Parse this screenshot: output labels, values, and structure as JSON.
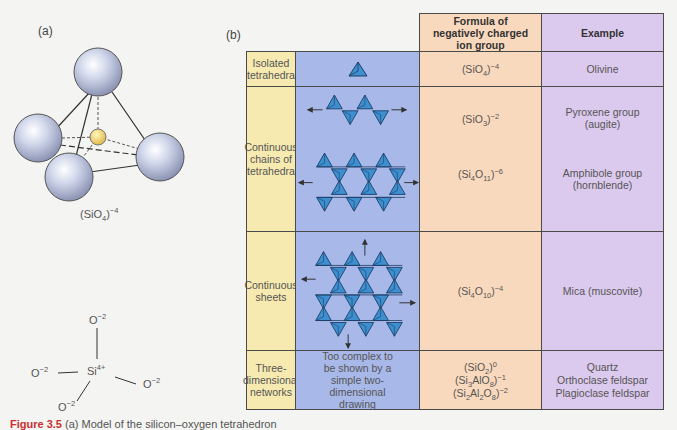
{
  "panel_a": {
    "label": "(a)",
    "formula": {
      "base": "(SiO",
      "sub": "4",
      "close": ")",
      "sup": "−4"
    },
    "bond_diagram": {
      "center": {
        "base": "Si",
        "sup": "4+"
      },
      "oxygens": [
        {
          "base": "O",
          "sup": "−2",
          "position": "top"
        },
        {
          "base": "O",
          "sup": "−2",
          "position": "left"
        },
        {
          "base": "O",
          "sup": "−2",
          "position": "right"
        },
        {
          "base": "O",
          "sup": "−2",
          "position": "bottom-left"
        }
      ]
    }
  },
  "panel_b": {
    "label": "(b)",
    "headers": {
      "formula": "Formula of negatively charged ion group",
      "example": "Example"
    },
    "rows": [
      {
        "structure": "Isolated tetrahedra",
        "diagram": "single-tetrahedron",
        "formulas": [
          {
            "html": "(SiO<sub>4</sub>)<sup>−4</sup>"
          }
        ],
        "examples": [
          "Olivine"
        ]
      },
      {
        "structure": "Continuous chains of tetrahedra",
        "diagram": "single-and-double-chains",
        "formulas": [
          {
            "html": "(SiO<sub>3</sub>)<sup>−2</sup>"
          },
          {
            "html": "(Si<sub>4</sub>O<sub>11</sub>)<sup>−6</sup>"
          }
        ],
        "examples": [
          "Pyroxene group (augite)",
          "Amphibole group (hornblende)"
        ]
      },
      {
        "structure": "Continuous sheets",
        "diagram": "sheet",
        "formulas": [
          {
            "html": "(Si<sub>4</sub>O<sub>10</sub>)<sup>−4</sup>"
          }
        ],
        "examples": [
          "Mica (muscovite)"
        ]
      },
      {
        "structure": "Three-dimensional networks",
        "diagram_text": "Too complex to be shown by a simple two-dimensional drawing",
        "formulas": [
          {
            "html": "(SiO<sub>2</sub>)<sup>0</sup>"
          },
          {
            "html": "(Si<sub>3</sub>AlO<sub>8</sub>)<sup>−1</sup>"
          },
          {
            "html": "(Si<sub>2</sub>Al<sub>2</sub>O<sub>8</sub>)<sup>−2</sup>"
          }
        ],
        "examples": [
          "Quartz",
          "Orthoclase feldspar",
          "Plagioclase feldspar"
        ]
      }
    ]
  },
  "caption": {
    "figure": "Figure 3.5",
    "text": "(a) Model of the silicon–oxygen tetrahedron"
  },
  "colors": {
    "structure_col": "#f6eab0",
    "diagram_col": "#a8b8e8",
    "formula_col": "#f9d9bd",
    "example_col": "#dcc9ee",
    "tetra_fill": "#3d8fd0",
    "caption_red": "#c8302f"
  }
}
